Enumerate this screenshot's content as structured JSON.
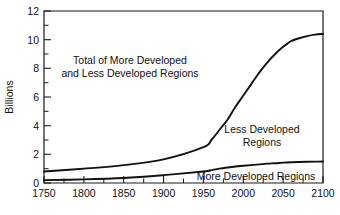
{
  "chart_data": {
    "type": "line",
    "title": "",
    "xlabel": "",
    "ylabel": "Billions",
    "xlim": [
      1750,
      2100
    ],
    "ylim": [
      0,
      12
    ],
    "grid": false,
    "legend_position": "inline-annotations",
    "xticks": [
      "1750",
      "1800",
      "1850",
      "1900",
      "1950",
      "2000",
      "2050",
      "2100"
    ],
    "yticks": [
      "0",
      "2",
      "4",
      "6",
      "8",
      "10",
      "12"
    ],
    "x": [
      1750,
      1800,
      1850,
      1900,
      1950,
      1960,
      1970,
      1980,
      1990,
      2000,
      2010,
      2020,
      2030,
      2040,
      2050,
      2060,
      2070,
      2080,
      2090,
      2100
    ],
    "series": [
      {
        "name": "Total of More Developed and Less Developed Regions",
        "values": [
          0.8,
          1.0,
          1.25,
          1.65,
          2.5,
          3.0,
          3.7,
          4.4,
          5.3,
          6.1,
          6.9,
          7.7,
          8.4,
          9.0,
          9.5,
          9.9,
          10.1,
          10.25,
          10.35,
          10.4
        ]
      },
      {
        "name": "More Developed Regions",
        "values": [
          0.2,
          0.25,
          0.35,
          0.55,
          0.8,
          0.9,
          1.0,
          1.08,
          1.15,
          1.2,
          1.25,
          1.3,
          1.35,
          1.38,
          1.42,
          1.45,
          1.47,
          1.48,
          1.49,
          1.5
        ]
      }
    ],
    "annotations": [
      {
        "name": "total-label",
        "lines": [
          "Total of More Developed",
          "and Less Developed Regions"
        ],
        "x": 130,
        "y": 64
      },
      {
        "name": "less-developed-label",
        "lines": [
          "Less Developed",
          "Regions"
        ],
        "x": 262,
        "y": 133
      },
      {
        "name": "more-developed-label",
        "lines": [
          "More Developed Regions"
        ],
        "x": 256,
        "y": 180
      }
    ],
    "colors": {
      "line": "#111111",
      "axis": "#1a1a1a",
      "background": "#ffffff"
    }
  }
}
